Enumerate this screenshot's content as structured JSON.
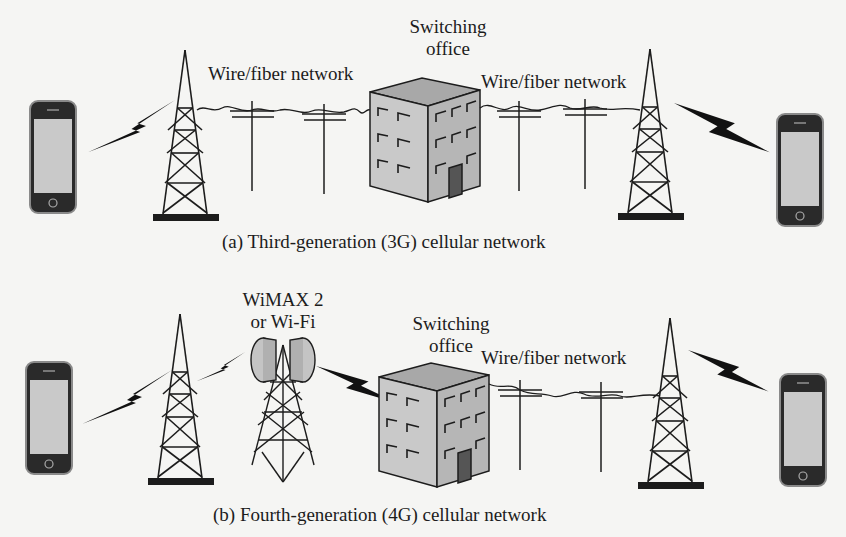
{
  "figure": {
    "panels": [
      {
        "id": "a",
        "caption": "(a) Third-generation (3G) cellular network",
        "labels": {
          "left_network": "Wire/fiber network",
          "switching_office_line1": "Switching",
          "switching_office_line2": "office",
          "right_network": "Wire/fiber network"
        },
        "nodes": [
          "smartphone",
          "cell-tower",
          "utility-pole",
          "utility-pole",
          "switching-office",
          "utility-pole",
          "utility-pole",
          "cell-tower",
          "smartphone"
        ],
        "links": [
          "wireless",
          "wire-fiber",
          "wire-fiber",
          "wireless"
        ]
      },
      {
        "id": "b",
        "caption": "(b) Fourth-generation (4G) cellular network",
        "labels": {
          "wireless_backhaul_line1": "WiMAX 2",
          "wireless_backhaul_line2": "or Wi-Fi",
          "switching_office_line1": "Switching",
          "switching_office_line2": "office",
          "right_network": "Wire/fiber network"
        },
        "nodes": [
          "smartphone",
          "cell-tower",
          "wimax-wifi-tower",
          "switching-office",
          "utility-pole",
          "utility-pole",
          "cell-tower",
          "smartphone"
        ],
        "links": [
          "wireless",
          "wireless",
          "wireless",
          "wire-fiber",
          "wireless"
        ]
      }
    ],
    "colors": {
      "ink": "#1c1c1c",
      "building_face": "#c8c8c8",
      "building_side": "#b4b4b4",
      "building_roof": "#a8a8a8",
      "door": "#555555",
      "phone_screen": "#c9c9c9",
      "antenna_dish": "#c4c4c4"
    }
  }
}
